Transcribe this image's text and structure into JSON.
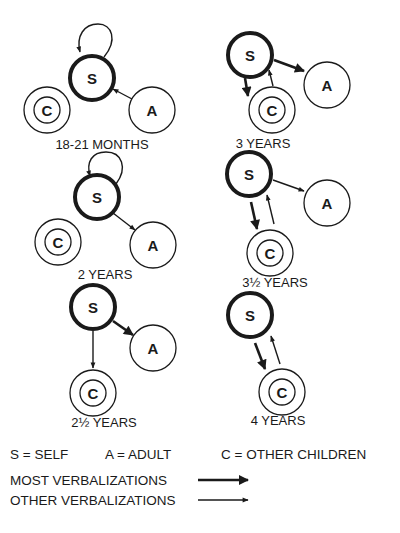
{
  "nodes": {
    "self": "S",
    "adult": "A",
    "children": "C"
  },
  "panels": [
    {
      "label": "18-21 MONTHS",
      "edges": [
        {
          "from": "A",
          "to": "S",
          "weight": "other"
        },
        {
          "from": "S",
          "to": "S",
          "weight": "other"
        }
      ]
    },
    {
      "label": "2 YEARS",
      "edges": [
        {
          "from": "S",
          "to": "S",
          "weight": "other"
        },
        {
          "from": "S",
          "to": "A",
          "weight": "other"
        }
      ]
    },
    {
      "label": "2½ YEARS",
      "edges": [
        {
          "from": "S",
          "to": "A",
          "weight": "most"
        },
        {
          "from": "S",
          "to": "C",
          "weight": "other"
        }
      ]
    },
    {
      "label": "3 YEARS",
      "edges": [
        {
          "from": "S",
          "to": "A",
          "weight": "most"
        },
        {
          "from": "S",
          "to": "C",
          "weight": "most"
        },
        {
          "from": "C",
          "to": "S",
          "weight": "other"
        }
      ]
    },
    {
      "label": "3½ YEARS",
      "edges": [
        {
          "from": "S",
          "to": "A",
          "weight": "other"
        },
        {
          "from": "S",
          "to": "C",
          "weight": "most"
        },
        {
          "from": "C",
          "to": "S",
          "weight": "other"
        }
      ]
    },
    {
      "label": "4 YEARS",
      "edges": [
        {
          "from": "S",
          "to": "C",
          "weight": "most"
        },
        {
          "from": "C",
          "to": "S",
          "weight": "other"
        }
      ]
    }
  ],
  "legend": {
    "self_key": "S = SELF",
    "adult_key": "A = ADULT",
    "children_key": "C = OTHER CHILDREN",
    "most_label": "MOST VERBALIZATIONS",
    "other_label": "OTHER VERBALIZATIONS"
  },
  "colors": {
    "ink": "#1a1a1a",
    "background": "#ffffff"
  }
}
